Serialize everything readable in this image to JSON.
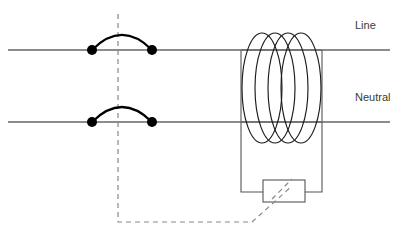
{
  "figure": {
    "kind": "circuit-schematic",
    "background_color": "#ffffff",
    "width": 405,
    "height": 245
  },
  "labels": {
    "line": "Line",
    "neutral": "Neutral"
  },
  "caption": {
    "text": "",
    "note_visible": "caption row is cropped by the bottom edge of the screenshot and is not legible"
  },
  "colors": {
    "conductor": "#666666",
    "core_outline": "#555555",
    "coil_winding": "#1a1a1a",
    "switch_arc": "#000000",
    "contact_dot": "#000000",
    "linkage_dashed": "#888888",
    "label": "#3a3a3a"
  },
  "geometry": {
    "conductors": [
      {
        "name": "line",
        "y": 50,
        "x_start": 8,
        "x_end": 390
      },
      {
        "name": "neutral",
        "y": 122,
        "x_start": 8,
        "x_end": 390
      }
    ],
    "switches": [
      {
        "name": "line-switch",
        "y": 50,
        "contact_left_x": 92,
        "contact_right_x": 152,
        "dot_radius": 5,
        "arc_rise": 22
      },
      {
        "name": "neutral-switch",
        "y": 122,
        "contact_left_x": 92,
        "contact_right_x": 152,
        "dot_radius": 5,
        "arc_rise": 22
      }
    ],
    "trip_linkage": {
      "vertical_x": 118,
      "vertical_y_top": 14,
      "vertical_y_bottom": 222,
      "horizontal_y": 222,
      "horizontal_x_end": 252,
      "diagonal_to_x": 292,
      "diagonal_to_y": 186
    },
    "core": {
      "left_x": 241,
      "right_x": 322,
      "top_y": 50,
      "bottom_y": 192
    },
    "coil": {
      "center_y": 88,
      "loop_count": 4,
      "loop_rx": 20,
      "loop_ry": 55,
      "first_center_x": 262,
      "spacing_x": 13
    },
    "solenoid_box": {
      "x": 263,
      "y": 180,
      "width": 42,
      "height": 22
    },
    "label_positions": {
      "line": {
        "x": 355,
        "y": 29
      },
      "neutral": {
        "x": 355,
        "y": 101
      }
    }
  }
}
